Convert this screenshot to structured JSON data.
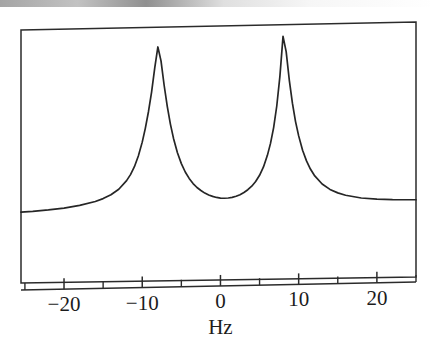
{
  "figure": {
    "title": "",
    "background_color": "#ffffff",
    "ink_color": "#262626",
    "scan_artifact": "gray-band-top-edge"
  },
  "axis": {
    "x_title": "Hz",
    "tick_labels": [
      "-20",
      "-10",
      "0",
      "10",
      "20"
    ],
    "tick_values": [
      -20,
      -10,
      0,
      10,
      20
    ],
    "minor_tick_values": [
      -25,
      -15,
      -5,
      5,
      15,
      25
    ]
  },
  "chart_data": {
    "type": "line",
    "title": "",
    "xlabel": "Hz",
    "ylabel": "",
    "xlim": [
      -25.5,
      25.0
    ],
    "ylim": [
      0,
      1
    ],
    "grid": false,
    "legend": "none",
    "annotations": [],
    "peaks": [
      {
        "center_hz": -8.0,
        "relative_height": 0.94,
        "halfwidth_hz": 1.9
      },
      {
        "center_hz": 8.0,
        "relative_height": 1.0,
        "halfwidth_hz": 1.9
      }
    ],
    "baseline_relative": 0.04,
    "valley": {
      "x_hz": -0.1,
      "relative_height": 0.115
    },
    "series": [
      {
        "name": "spectrum",
        "x": [
          -25.5,
          -24,
          -22,
          -20,
          -18,
          -16,
          -15,
          -14,
          -13,
          -12,
          -11.5,
          -11,
          -10.5,
          -10,
          -9.6,
          -9.2,
          -8.8,
          -8.4,
          -8.0,
          -7.6,
          -7.2,
          -6.8,
          -6.4,
          -6.0,
          -5.5,
          -5.0,
          -4.5,
          -4.0,
          -3.5,
          -3.0,
          -2.5,
          -2.0,
          -1.5,
          -1.0,
          -0.5,
          0.0,
          0.5,
          1.0,
          1.5,
          2.0,
          2.5,
          3.0,
          3.5,
          4.0,
          4.5,
          5.0,
          5.5,
          6.0,
          6.4,
          6.8,
          7.2,
          7.6,
          8.0,
          8.4,
          8.8,
          9.2,
          9.6,
          10.0,
          10.5,
          11.0,
          11.5,
          12.0,
          13.0,
          14.0,
          15.0,
          16.0,
          18.0,
          20.0,
          22.0,
          24.0,
          25.0
        ],
        "y": [
          0.072,
          0.075,
          0.081,
          0.089,
          0.101,
          0.12,
          0.134,
          0.153,
          0.181,
          0.225,
          0.256,
          0.297,
          0.352,
          0.424,
          0.497,
          0.583,
          0.685,
          0.81,
          0.918,
          0.845,
          0.718,
          0.608,
          0.515,
          0.44,
          0.365,
          0.308,
          0.264,
          0.23,
          0.203,
          0.182,
          0.166,
          0.152,
          0.142,
          0.134,
          0.128,
          0.124,
          0.123,
          0.124,
          0.127,
          0.132,
          0.14,
          0.151,
          0.165,
          0.183,
          0.207,
          0.239,
          0.282,
          0.342,
          0.404,
          0.486,
          0.598,
          0.752,
          0.96,
          0.88,
          0.732,
          0.611,
          0.515,
          0.44,
          0.365,
          0.309,
          0.266,
          0.233,
          0.187,
          0.158,
          0.139,
          0.126,
          0.11,
          0.102,
          0.098,
          0.096,
          0.095
        ]
      }
    ]
  }
}
